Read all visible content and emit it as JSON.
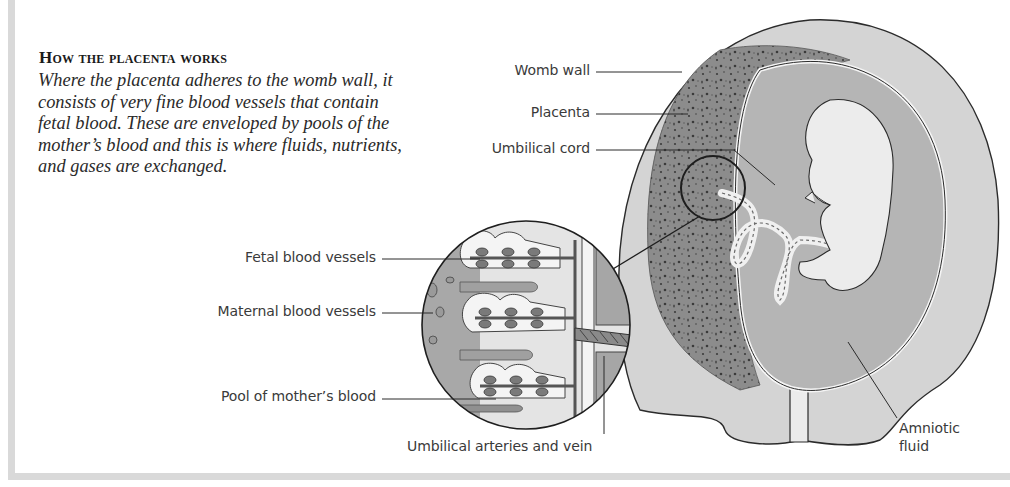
{
  "figure": {
    "heading": "How the placenta works",
    "description": "Where the placenta adheres to the womb wall, it consists of very fine blood vessels that contain fetal blood. These are enveloped by pools of the mother’s blood and this is where fluids, nutrients, and gases are exchanged.",
    "labels": {
      "womb_wall": "Womb wall",
      "placenta": "Placenta",
      "umbilical_cord": "Umbilical cord",
      "fetal_blood_vessels": "Fetal blood vessels",
      "maternal_blood_vessels": "Maternal blood vessels",
      "pool_of_mothers_blood": "Pool of mother’s blood",
      "umbilical_arteries_and_vein": "Umbilical arteries and vein",
      "amniotic_fluid_line1": "Amniotic",
      "amniotic_fluid_line2": "fluid"
    },
    "colors": {
      "frame": "#d9d9d9",
      "womb_wall": "#d4d4d4",
      "placenta": "#8a8a8a",
      "amniotic": "#b5b5b5",
      "fetus": "#ececec",
      "outline": "#2b2b2b"
    }
  }
}
